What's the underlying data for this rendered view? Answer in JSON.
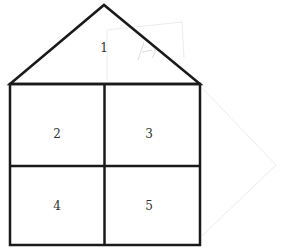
{
  "diagram": {
    "type": "house-shape",
    "regions": [
      {
        "id": 1,
        "label": "1",
        "shape": "triangle-roof"
      },
      {
        "id": 2,
        "label": "2",
        "shape": "square",
        "position": "top-left"
      },
      {
        "id": 3,
        "label": "3",
        "shape": "square",
        "position": "top-right"
      },
      {
        "id": 4,
        "label": "4",
        "shape": "square",
        "position": "bottom-left"
      },
      {
        "id": 5,
        "label": "5",
        "shape": "square",
        "position": "bottom-right"
      }
    ],
    "faint_marks": [
      "x5",
      "x1"
    ],
    "line_color": "#1a1a1a",
    "faint_color": "#e6e6e6"
  }
}
